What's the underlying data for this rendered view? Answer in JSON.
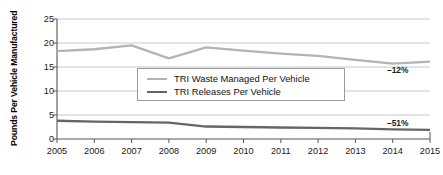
{
  "chart_data": {
    "type": "line",
    "title": "",
    "xlabel": "",
    "ylabel": "Pounds Per Vehicle Manufactured",
    "categories": [
      "2005",
      "2006",
      "2007",
      "2008",
      "2009",
      "2010",
      "2011",
      "2012",
      "2013",
      "2014",
      "2015"
    ],
    "x": [
      2005,
      2006,
      2007,
      2008,
      2009,
      2010,
      2011,
      2012,
      2013,
      2014,
      2015
    ],
    "ylim": [
      0,
      25
    ],
    "yticks": [
      0,
      5,
      10,
      15,
      20,
      25
    ],
    "ytick_labels": [
      "0",
      "5",
      "10",
      "15",
      "20",
      "25"
    ],
    "xlim": [
      2005,
      2015
    ],
    "grid": true,
    "grid_axis": "y",
    "legend_position": "center",
    "series": [
      {
        "name": "TRI Waste Managed Per Vehicle",
        "color": "#b4b4b4",
        "values": [
          18.3,
          18.7,
          19.5,
          16.8,
          19.1,
          18.4,
          17.8,
          17.3,
          16.5,
          15.7,
          16.1
        ]
      },
      {
        "name": "TRI Releases Per Vehicle",
        "color": "#666666",
        "values": [
          3.8,
          3.6,
          3.5,
          3.4,
          2.6,
          2.5,
          2.4,
          2.3,
          2.2,
          2.0,
          1.9
        ]
      }
    ],
    "annotations": [
      {
        "text": "–12%",
        "series": "TRI Waste Managed Per Vehicle",
        "x": 2014.1,
        "y": 14.3
      },
      {
        "text": "–51%",
        "series": "TRI Releases Per Vehicle",
        "x": 2014.1,
        "y": 3.3
      }
    ]
  },
  "colors": {
    "waste_line": "#b4b4b4",
    "releases_line": "#666666",
    "grid": "#c8c8c8",
    "axis": "#555555",
    "text": "#1a1a1a"
  }
}
